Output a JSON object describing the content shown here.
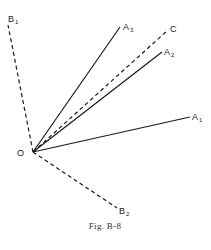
{
  "figure": {
    "caption": "Fig. B-8",
    "origin": {
      "label": "O",
      "x": 33,
      "y": 152
    },
    "vectors": [
      {
        "id": "B1",
        "base": "B",
        "sub": "1",
        "style": "dashed",
        "x": 8,
        "y": 25,
        "lx": 8,
        "ly": 22
      },
      {
        "id": "A3",
        "base": "A",
        "sub": "3",
        "style": "solid",
        "x": 120,
        "y": 27,
        "lx": 123,
        "ly": 30
      },
      {
        "id": "C",
        "base": "C",
        "sub": "",
        "style": "dashed",
        "x": 168,
        "y": 30,
        "lx": 170,
        "ly": 32
      },
      {
        "id": "A2",
        "base": "A",
        "sub": "2",
        "style": "solid",
        "x": 162,
        "y": 52,
        "lx": 164,
        "ly": 55
      },
      {
        "id": "A1",
        "base": "A",
        "sub": "1",
        "style": "solid",
        "x": 190,
        "y": 117,
        "lx": 192,
        "ly": 120
      },
      {
        "id": "B2",
        "base": "B",
        "sub": "2",
        "style": "dashed",
        "x": 117,
        "y": 208,
        "lx": 119,
        "ly": 214
      }
    ],
    "colors": {
      "line": "#1a1a1a",
      "text": "#222222"
    }
  }
}
